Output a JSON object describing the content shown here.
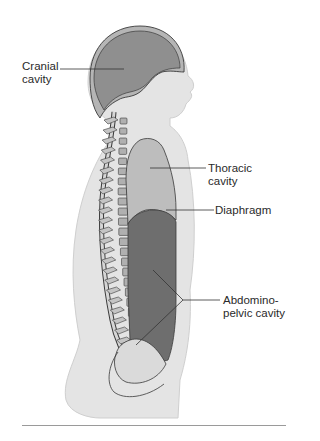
{
  "figure": {
    "labels": {
      "cranial": "Cranial\ncavity",
      "thoracic": "Thoracic\ncavity",
      "diaphragm": "Diaphragm",
      "abdominopelvic": "Abdomino-\npelvic cavity"
    },
    "colors": {
      "body": "#e4e4e4",
      "body_outline": "#c8c8c8",
      "cranial_cavity": "#8f8f8f",
      "skull": "#b5b5b5",
      "thoracic_cavity": "#bdbdbd",
      "abdominopelvic_cavity": "#6e6e6e",
      "pelvic_lower": "#dadada",
      "vertebra": "#b0b0b0",
      "outline": "#3a3a3a",
      "leader": "#333333",
      "rule": "#9a9a9a"
    }
  }
}
